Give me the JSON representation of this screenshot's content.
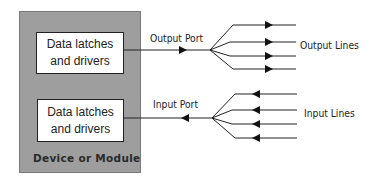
{
  "diagram": {
    "module": {
      "label": "Device or Module",
      "blocks": [
        {
          "line1": "Data latches",
          "line2": "and drivers"
        },
        {
          "line1": "Data latches",
          "line2": "and drivers"
        }
      ]
    },
    "output": {
      "port_label": "Output Port",
      "lines_label": "Output Lines",
      "line_count": 4
    },
    "input": {
      "port_label": "Input Port",
      "lines_label": "Input Lines",
      "line_count": 4
    },
    "colors": {
      "module_fill": "#9e9e9e",
      "block_fill": "#ffffff",
      "stroke": "#222222"
    }
  }
}
